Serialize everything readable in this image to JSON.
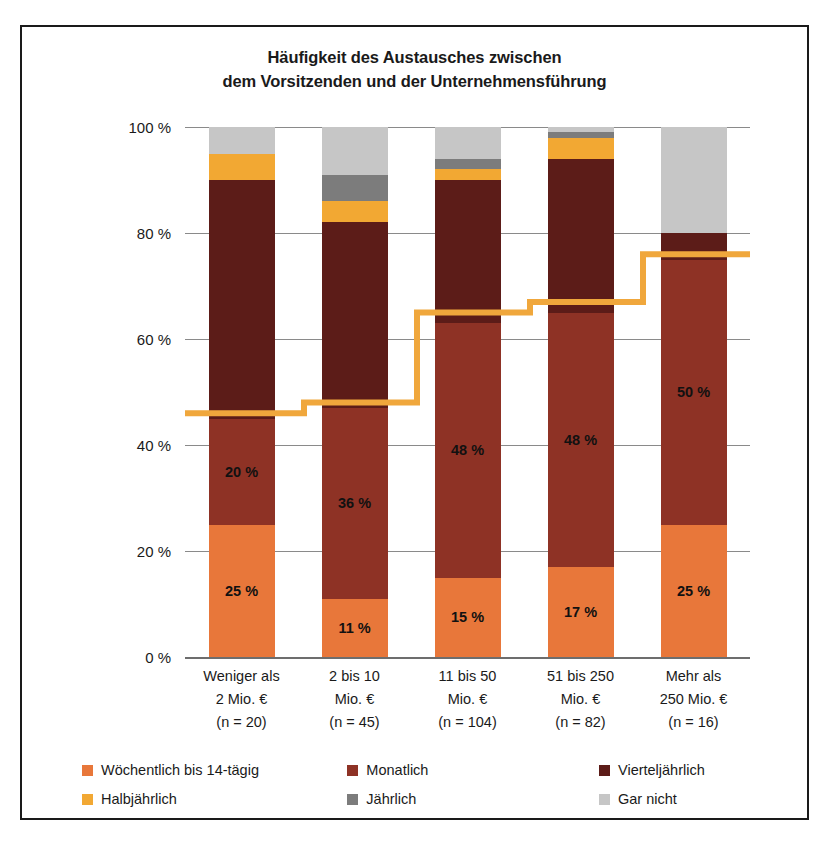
{
  "chart_data": {
    "type": "bar",
    "stacked": true,
    "title": "Häufigkeit des Austausches zwischen dem Vorsitzenden und der Unternehmensführung",
    "title_lines": [
      "Häufigkeit des Austausches zwischen",
      "dem Vorsitzenden und der Unternehmensführung"
    ],
    "xlabel": "",
    "ylabel": "",
    "ylim": [
      0,
      100
    ],
    "yticks": [
      "0 %",
      "20 %",
      "40 %",
      "60 %",
      "80 %",
      "100 %"
    ],
    "ytick_values": [
      0,
      20,
      40,
      60,
      80,
      100
    ],
    "grid": true,
    "legend_position": "bottom",
    "categories": [
      "Weniger als 2 Mio. € (n = 20)",
      "2 bis 10 Mio. € (n = 45)",
      "11 bis 50 Mio. € (n = 104)",
      "51 bis 250 Mio. € (n = 82)",
      "Mehr als 250 Mio. € (n = 16)"
    ],
    "category_lines": [
      [
        "Weniger als",
        "2 Mio. €",
        "(n = 20)"
      ],
      [
        "2 bis 10",
        "Mio. €",
        "(n = 45)"
      ],
      [
        "11 bis 50",
        "Mio. €",
        "(n = 104)"
      ],
      [
        "51 bis 250",
        "Mio. €",
        "(n = 82)"
      ],
      [
        "Mehr als",
        "250 Mio. €",
        "(n = 16)"
      ]
    ],
    "series": [
      {
        "name": "Wöchentlich bis 14-tägig",
        "color": "#E8773A",
        "values": [
          25,
          11,
          15,
          17,
          25
        ],
        "labels": [
          "25 %",
          "11 %",
          "15 %",
          "17 %",
          "25 %"
        ]
      },
      {
        "name": "Monatlich",
        "color": "#8E3225",
        "values": [
          20,
          36,
          48,
          48,
          50
        ],
        "labels": [
          "20 %",
          "36 %",
          "48 %",
          "48 %",
          "50 %"
        ]
      },
      {
        "name": "Vierteljährlich",
        "color": "#5C1C18",
        "values": [
          45,
          35,
          27,
          29,
          5
        ],
        "labels": [
          "",
          "",
          "",
          "",
          ""
        ]
      },
      {
        "name": "Halbjährlich",
        "color": "#F2A833",
        "values": [
          5,
          4,
          2,
          4,
          0
        ],
        "labels": [
          "",
          "",
          "",
          "",
          ""
        ]
      },
      {
        "name": "Jährlich",
        "color": "#7C7C7C",
        "values": [
          0,
          5,
          2,
          1,
          0
        ],
        "labels": [
          "",
          "",
          "",
          "",
          ""
        ]
      },
      {
        "name": "Gar nicht",
        "color": "#C6C6C6",
        "values": [
          5,
          9,
          6,
          1,
          20
        ],
        "labels": [
          "",
          "",
          "",
          "",
          ""
        ]
      }
    ],
    "step_line": {
      "name": "Kumuliert",
      "color": "#F0A73C",
      "values": [
        46,
        48,
        65,
        67,
        76
      ],
      "segments": [
        46,
        47,
        48,
        65,
        66,
        67,
        76
      ]
    }
  },
  "legend": {
    "rows": [
      [
        {
          "label": "Wöchentlich bis 14-tägig",
          "color": "#E8773A"
        },
        {
          "label": "Monatlich",
          "color": "#8E3225"
        },
        {
          "label": "Vierteljährlich",
          "color": "#5C1C18"
        }
      ],
      [
        {
          "label": "Halbjährlich",
          "color": "#F2A833"
        },
        {
          "label": "Jährlich",
          "color": "#7C7C7C"
        },
        {
          "label": "Gar nicht",
          "color": "#C6C6C6"
        }
      ]
    ]
  }
}
